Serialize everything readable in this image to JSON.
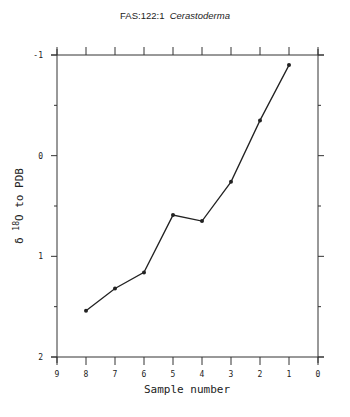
{
  "chart_data": {
    "type": "line",
    "title_parts": {
      "code": "FAS:122:1",
      "taxon": "Cerastoderma"
    },
    "xlabel": "Sample number",
    "ylabel": "δ 18O to PDB",
    "ylabel_parts": {
      "prefix": "δ",
      "sup": "18",
      "suffix": "O to PDB"
    },
    "x_reversed": true,
    "y_inverted": true,
    "xlim": [
      9,
      0
    ],
    "ylim": [
      -1,
      2
    ],
    "x_ticks": [
      9,
      8,
      7,
      6,
      5,
      4,
      3,
      2,
      1,
      0
    ],
    "x_tick_labels": [
      "9",
      "8",
      "7",
      "6",
      "5",
      "4",
      "3",
      "2",
      "1",
      "0"
    ],
    "y_ticks": [
      -1,
      0,
      1,
      2
    ],
    "y_tick_labels": [
      "-1",
      "0",
      "1",
      "2"
    ],
    "y_minor_ticks": [
      -0.5,
      0.5,
      1.5
    ],
    "grid": false,
    "legend": null,
    "series": [
      {
        "name": "Cerastoderma",
        "x": [
          8,
          7,
          6,
          5,
          4,
          3,
          2,
          1
        ],
        "values": [
          1.54,
          1.32,
          1.16,
          0.59,
          0.65,
          0.26,
          -0.35,
          -0.9
        ]
      }
    ],
    "colors": {
      "line": "#222222",
      "axis": "#333333"
    }
  }
}
